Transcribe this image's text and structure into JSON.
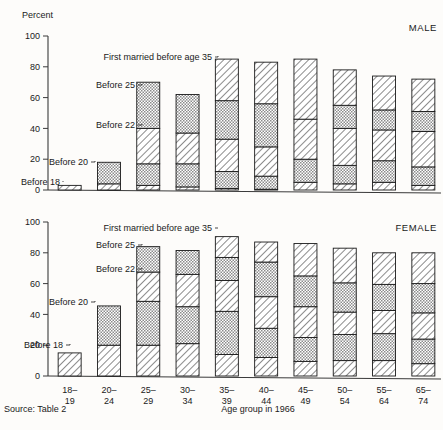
{
  "figure": {
    "axis_y_title": "Percent",
    "axis_x_title": "Age group in 1966",
    "source": "Source:  Table 2",
    "panel_male": "MALE",
    "panel_female": "FEMALE"
  },
  "annotations": {
    "before18": "Before 18",
    "before20": "Before 20",
    "before22": "Before 22",
    "before25": "Before 25",
    "before35": "First married before age 35"
  },
  "chart_data": {
    "type": "bar",
    "subtype": "stacked-cumulative",
    "title": "",
    "xlabel": "Age group in 1966",
    "ylabel": "Percent",
    "ylim": [
      0,
      100
    ],
    "yticks": [
      0,
      20,
      40,
      60,
      80,
      100
    ],
    "grid": false,
    "legend_position": "inline-annotations",
    "categories": [
      "18–19",
      "20–24",
      "25–29",
      "30–34",
      "35–39",
      "40–44",
      "45–49",
      "50–54",
      "55–64",
      "65–74"
    ],
    "legend": [
      "Before 18",
      "Before 20",
      "Before 22",
      "Before 25",
      "First married before age 35"
    ],
    "panels": [
      {
        "name": "MALE",
        "cumulative_series": [
          {
            "name": "Before 18",
            "values": [
              3,
              4,
              3,
              2,
              1,
              0.5,
              5,
              4,
              5,
              3
            ]
          },
          {
            "name": "Before 20",
            "values": [
              3,
              4,
              17,
              17,
              12,
              9,
              20,
              16,
              19,
              15
            ]
          },
          {
            "name": "Before 22",
            "values": [
              3,
              4,
              40,
              37,
              33,
              28,
              46,
              40,
              39,
              38
            ]
          },
          {
            "name": "Before 25",
            "values": [
              3,
              18,
              70,
              62,
              58,
              56,
              46,
              55,
              52,
              51
            ]
          },
          {
            "name": "First married before age 35",
            "values": [
              3,
              18,
              70,
              62,
              85,
              83,
              85,
              78,
              74,
              72
            ]
          }
        ]
      },
      {
        "name": "FEMALE",
        "cumulative_series": [
          {
            "name": "Before 18",
            "values": [
              15,
              20,
              20,
              21,
              14,
              12,
              9.5,
              10,
              10,
              8
            ]
          },
          {
            "name": "Before 20",
            "values": [
              15,
              45.5,
              48.5,
              45,
              42,
              31,
              25,
              27,
              27.5,
              24
            ]
          },
          {
            "name": "Before 22",
            "values": [
              15,
              45.5,
              67.5,
              66,
              62,
              51.5,
              45,
              41.5,
              42.5,
              41
            ]
          },
          {
            "name": "Before 25",
            "values": [
              15,
              45.5,
              84,
              81.5,
              77,
              74,
              65,
              60.5,
              59.5,
              60
            ]
          },
          {
            "name": "First married before age 35",
            "values": [
              15,
              45.5,
              84,
              81.5,
              90.5,
              87,
              86,
              83,
              80,
              80
            ]
          }
        ]
      }
    ]
  }
}
